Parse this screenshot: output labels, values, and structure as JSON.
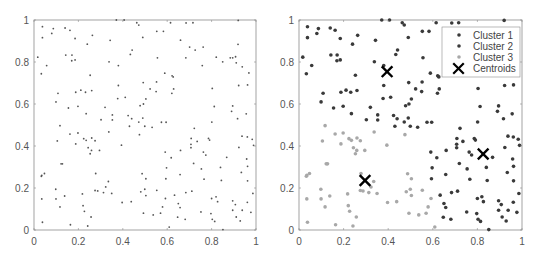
{
  "chart_data": [
    {
      "type": "scatter",
      "title": "",
      "xlabel": "",
      "ylabel": "",
      "xlim": [
        0,
        1
      ],
      "ylim": [
        0,
        1
      ],
      "x_ticks": [
        "0",
        "0.2",
        "0.4",
        "0.6",
        "0.8",
        "1"
      ],
      "y_ticks": [
        "0",
        "0.2",
        "0.4",
        "0.6",
        "0.8",
        "1"
      ],
      "grid": false,
      "legend": null,
      "point_color": "#555555",
      "description": "Unclustered data points"
    },
    {
      "type": "scatter",
      "title": "",
      "xlabel": "",
      "ylabel": "",
      "xlim": [
        0,
        1
      ],
      "ylim": [
        0,
        1
      ],
      "x_ticks": [
        "0",
        "0.2",
        "0.4",
        "0.6",
        "0.8",
        "1"
      ],
      "y_ticks": [
        "0",
        "0.2",
        "0.4",
        "0.6",
        "0.8",
        "1"
      ],
      "grid": false,
      "legend": {
        "position": "upper right",
        "entries": [
          "Cluster 1",
          "Cluster 2",
          "Cluster 3",
          "Centroids"
        ]
      },
      "series": [
        {
          "name": "Cluster 1",
          "color": "#3a3a3a",
          "marker": "dot"
        },
        {
          "name": "Cluster 2",
          "color": "#3a3a3a",
          "marker": "dot"
        },
        {
          "name": "Cluster 3",
          "color": "#a8a8a8",
          "marker": "dot"
        },
        {
          "name": "Centroids",
          "color": "#000000",
          "marker": "x",
          "points": [
            [
              0.395,
              0.754
            ],
            [
              0.826,
              0.362
            ],
            [
              0.296,
              0.236
            ]
          ]
        }
      ]
    }
  ],
  "points": [
    [
      0.038,
      0.968
    ],
    [
      0.038,
      0.916
    ],
    [
      0.08,
      0.936
    ],
    [
      0.087,
      0.959
    ],
    [
      0.14,
      0.962
    ],
    [
      0.162,
      0.951
    ],
    [
      0.185,
      0.912
    ],
    [
      0.017,
      0.823
    ],
    [
      0.057,
      0.783
    ],
    [
      0.033,
      0.744
    ],
    [
      0.143,
      0.833
    ],
    [
      0.171,
      0.833
    ],
    [
      0.17,
      0.806
    ],
    [
      0.185,
      0.81
    ],
    [
      0.24,
      0.885
    ],
    [
      0.263,
      0.927
    ],
    [
      0.253,
      0.737
    ],
    [
      0.343,
      0.903
    ],
    [
      0.338,
      0.801
    ],
    [
      0.371,
      1.0
    ],
    [
      0.406,
      1.0
    ],
    [
      0.434,
      0.836
    ],
    [
      0.442,
      0.857
    ],
    [
      0.38,
      0.783
    ],
    [
      0.463,
      0.987
    ],
    [
      0.472,
      0.976
    ],
    [
      0.49,
      0.917
    ],
    [
      0.553,
      0.946
    ],
    [
      0.583,
      0.946
    ],
    [
      0.556,
      0.82
    ],
    [
      0.615,
      0.987
    ],
    [
      0.685,
      0.986
    ],
    [
      0.716,
      0.987
    ],
    [
      0.66,
      0.904
    ],
    [
      0.701,
      0.871
    ],
    [
      0.726,
      0.857
    ],
    [
      0.762,
      0.871
    ],
    [
      0.684,
      0.82
    ],
    [
      0.758,
      0.783
    ],
    [
      0.92,
      0.998
    ],
    [
      0.919,
      0.884
    ],
    [
      0.821,
      0.823
    ],
    [
      0.85,
      0.801
    ],
    [
      0.884,
      0.82
    ],
    [
      0.895,
      0.82
    ],
    [
      0.908,
      0.825
    ],
    [
      0.911,
      0.796
    ],
    [
      0.938,
      0.777
    ],
    [
      0.968,
      0.748
    ],
    [
      0.589,
      0.747
    ],
    [
      0.622,
      0.734
    ],
    [
      0.627,
      0.729
    ],
    [
      0.552,
      0.705
    ],
    [
      0.492,
      0.702
    ],
    [
      0.38,
      0.688
    ],
    [
      0.523,
      0.672
    ],
    [
      0.55,
      0.659
    ],
    [
      0.629,
      0.672
    ],
    [
      0.621,
      0.651
    ],
    [
      0.922,
      0.688
    ],
    [
      0.962,
      0.691
    ],
    [
      0.803,
      0.674
    ],
    [
      0.108,
      0.651
    ],
    [
      0.099,
      0.61
    ],
    [
      0.211,
      0.666
    ],
    [
      0.188,
      0.656
    ],
    [
      0.232,
      0.656
    ],
    [
      0.26,
      0.664
    ],
    [
      0.155,
      0.581
    ],
    [
      0.198,
      0.589
    ],
    [
      0.377,
      0.626
    ],
    [
      0.411,
      0.632
    ],
    [
      0.32,
      0.584
    ],
    [
      0.493,
      0.6
    ],
    [
      0.504,
      0.624
    ],
    [
      0.478,
      0.592
    ],
    [
      0.595,
      0.513
    ],
    [
      0.812,
      0.588
    ],
    [
      0.89,
      0.565
    ],
    [
      0.895,
      0.591
    ],
    [
      0.956,
      0.553
    ],
    [
      0.917,
      0.53
    ],
    [
      0.235,
      0.554
    ],
    [
      0.302,
      0.525
    ],
    [
      0.353,
      0.548
    ],
    [
      0.353,
      0.524
    ],
    [
      0.424,
      0.545
    ],
    [
      0.44,
      0.53
    ],
    [
      0.43,
      0.494
    ],
    [
      0.472,
      0.514
    ],
    [
      0.49,
      0.533
    ],
    [
      0.499,
      0.494
    ],
    [
      0.532,
      0.489
    ],
    [
      0.574,
      0.513
    ],
    [
      0.801,
      0.514
    ],
    [
      0.722,
      0.484
    ],
    [
      0.117,
      0.497
    ],
    [
      0.162,
      0.457
    ],
    [
      0.198,
      0.462
    ],
    [
      0.105,
      0.424
    ],
    [
      0.188,
      0.41
    ],
    [
      0.224,
      0.435
    ],
    [
      0.235,
      0.427
    ],
    [
      0.26,
      0.438
    ],
    [
      0.275,
      0.425
    ],
    [
      0.244,
      0.392
    ],
    [
      0.259,
      0.379
    ],
    [
      0.253,
      0.363
    ],
    [
      0.295,
      0.379
    ],
    [
      0.337,
      0.467
    ],
    [
      0.394,
      0.404
    ],
    [
      0.475,
      0.454
    ],
    [
      0.708,
      0.436
    ],
    [
      0.735,
      0.422
    ],
    [
      0.786,
      0.436
    ],
    [
      0.791,
      0.428
    ],
    [
      0.707,
      0.408
    ],
    [
      0.707,
      0.392
    ],
    [
      0.763,
      0.371
    ],
    [
      0.774,
      0.357
    ],
    [
      0.66,
      0.379
    ],
    [
      0.591,
      0.371
    ],
    [
      0.618,
      0.344
    ],
    [
      0.868,
      0.346
    ],
    [
      0.937,
      0.447
    ],
    [
      0.961,
      0.443
    ],
    [
      0.983,
      0.432
    ],
    [
      0.989,
      0.403
    ],
    [
      0.923,
      0.393
    ],
    [
      0.958,
      0.338
    ],
    [
      0.962,
      0.303
    ],
    [
      0.986,
      0.174
    ],
    [
      0.122,
      0.315
    ],
    [
      0.128,
      0.315
    ],
    [
      0.035,
      0.26
    ],
    [
      0.047,
      0.269
    ],
    [
      0.033,
      0.256
    ],
    [
      0.278,
      0.269
    ],
    [
      0.719,
      0.317
    ],
    [
      0.754,
      0.291
    ],
    [
      0.658,
      0.264
    ],
    [
      0.597,
      0.296
    ],
    [
      0.934,
      0.274
    ],
    [
      0.962,
      0.234
    ],
    [
      0.766,
      0.242
    ],
    [
      0.84,
      0.298
    ],
    [
      0.844,
      0.236
    ],
    [
      0.487,
      0.268
    ],
    [
      0.594,
      0.244
    ],
    [
      0.504,
      0.244
    ],
    [
      0.335,
      0.231
    ],
    [
      0.323,
      0.205
    ],
    [
      0.275,
      0.188
    ],
    [
      0.287,
      0.186
    ],
    [
      0.313,
      0.178
    ],
    [
      0.35,
      0.174
    ],
    [
      0.218,
      0.172
    ],
    [
      0.098,
      0.194
    ],
    [
      0.099,
      0.148
    ],
    [
      0.138,
      0.162
    ],
    [
      0.117,
      0.11
    ],
    [
      0.221,
      0.116
    ],
    [
      0.227,
      0.089
    ],
    [
      0.257,
      0.062
    ],
    [
      0.242,
      0.019
    ],
    [
      0.164,
      0.025
    ],
    [
      0.038,
      0.037
    ],
    [
      0.035,
      0.148
    ],
    [
      0.397,
      0.131
    ],
    [
      0.438,
      0.135
    ],
    [
      0.481,
      0.182
    ],
    [
      0.499,
      0.194
    ],
    [
      0.504,
      0.164
    ],
    [
      0.493,
      0.08
    ],
    [
      0.537,
      0.072
    ],
    [
      0.553,
      0.189
    ],
    [
      0.592,
      0.15
    ],
    [
      0.579,
      0.11
    ],
    [
      0.57,
      0.08
    ],
    [
      0.633,
      0.166
    ],
    [
      0.65,
      0.126
    ],
    [
      0.658,
      0.107
    ],
    [
      0.647,
      0.061
    ],
    [
      0.681,
      0.051
    ],
    [
      0.684,
      0.178
    ],
    [
      0.711,
      0.185
    ],
    [
      0.752,
      0.086
    ],
    [
      0.797,
      0.078
    ],
    [
      0.8,
      0.15
    ],
    [
      0.82,
      0.158
    ],
    [
      0.827,
      0.135
    ],
    [
      0.803,
      0.051
    ],
    [
      0.814,
      0.041
    ],
    [
      0.851,
      0.002
    ],
    [
      0.895,
      0.139
    ],
    [
      0.907,
      0.121
    ],
    [
      0.895,
      0.094
    ],
    [
      0.911,
      0.062
    ],
    [
      0.929,
      0.043
    ],
    [
      0.938,
      0.094
    ],
    [
      0.961,
      0.132
    ],
    [
      0.977,
      0.084
    ],
    [
      0.609,
      0.014
    ]
  ],
  "colors": {
    "axis": "#8c8c8c",
    "tick_label": "#555555",
    "raw_point": "#555555",
    "cluster_dark": "#3a3a3a",
    "cluster_light": "#a8a8a8",
    "centroid": "#000000"
  }
}
